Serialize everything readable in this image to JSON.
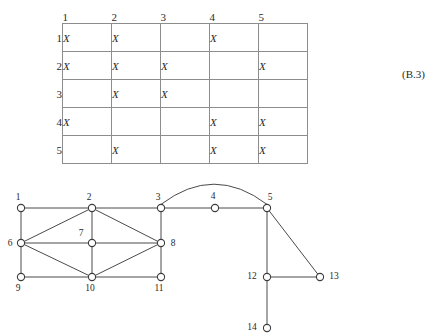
{
  "equation_tag": "(B.3)",
  "matrix": {
    "column_headers": [
      "1",
      "2",
      "3",
      "4",
      "5"
    ],
    "row_headers": [
      "1",
      "2",
      "3",
      "4",
      "5"
    ],
    "mark": "X",
    "rows": [
      [
        "X",
        "X",
        "",
        "X",
        ""
      ],
      [
        "X",
        "X",
        "X",
        "",
        "X"
      ],
      [
        "",
        "X",
        "X",
        "",
        ""
      ],
      [
        "X",
        "",
        "",
        "X",
        "X"
      ],
      [
        "",
        "X",
        "",
        "X",
        "X"
      ]
    ]
  },
  "graph": {
    "nodes": [
      {
        "id": "1",
        "label": "1",
        "cx": 21,
        "cy": 30,
        "lx": 18,
        "ly": 22,
        "anchor": "middle"
      },
      {
        "id": "2",
        "label": "2",
        "cx": 92,
        "cy": 30,
        "lx": 89,
        "ly": 22,
        "anchor": "middle"
      },
      {
        "id": "3",
        "label": "3",
        "cx": 161,
        "cy": 30,
        "lx": 158,
        "ly": 22,
        "anchor": "middle"
      },
      {
        "id": "4",
        "label": "4",
        "cx": 215,
        "cy": 30,
        "lx": 213,
        "ly": 21,
        "anchor": "middle"
      },
      {
        "id": "5",
        "label": "5",
        "cx": 267,
        "cy": 30,
        "lx": 270,
        "ly": 22,
        "anchor": "middle"
      },
      {
        "id": "6",
        "label": "6",
        "cx": 21,
        "cy": 65,
        "lx": 10,
        "ly": 68,
        "anchor": "middle"
      },
      {
        "id": "7",
        "label": "7",
        "cx": 92,
        "cy": 65,
        "lx": 81,
        "ly": 58,
        "anchor": "middle"
      },
      {
        "id": "8",
        "label": "8",
        "cx": 161,
        "cy": 65,
        "lx": 173,
        "ly": 68,
        "anchor": "middle"
      },
      {
        "id": "9",
        "label": "9",
        "cx": 21,
        "cy": 99,
        "lx": 18,
        "ly": 113,
        "anchor": "middle"
      },
      {
        "id": "10",
        "label": "10",
        "cx": 92,
        "cy": 99,
        "lx": 90,
        "ly": 113,
        "anchor": "middle"
      },
      {
        "id": "11",
        "label": "11",
        "cx": 161,
        "cy": 99,
        "lx": 159,
        "ly": 113,
        "anchor": "middle"
      },
      {
        "id": "12",
        "label": "12",
        "cx": 267,
        "cy": 99,
        "lx": 252,
        "ly": 101,
        "anchor": "middle"
      },
      {
        "id": "13",
        "label": "13",
        "cx": 320,
        "cy": 99,
        "lx": 334,
        "ly": 101,
        "anchor": "middle"
      },
      {
        "id": "14",
        "label": "14",
        "cx": 267,
        "cy": 150,
        "lx": 252,
        "ly": 152,
        "anchor": "middle"
      }
    ],
    "edges": [
      [
        "1",
        "2"
      ],
      [
        "2",
        "3"
      ],
      [
        "3",
        "4"
      ],
      [
        "4",
        "5"
      ],
      [
        "1",
        "6"
      ],
      [
        "3",
        "8"
      ],
      [
        "6",
        "9"
      ],
      [
        "8",
        "11"
      ],
      [
        "9",
        "10"
      ],
      [
        "10",
        "11"
      ],
      [
        "6",
        "2"
      ],
      [
        "2",
        "8"
      ],
      [
        "6",
        "10"
      ],
      [
        "10",
        "8"
      ],
      [
        "6",
        "7"
      ],
      [
        "7",
        "8"
      ],
      [
        "2",
        "7"
      ],
      [
        "7",
        "10"
      ],
      [
        "5",
        "12"
      ],
      [
        "5",
        "13"
      ],
      [
        "12",
        "13"
      ],
      [
        "12",
        "14"
      ]
    ],
    "arc_edge": {
      "from": "3",
      "to": "5",
      "peak_y": 8
    }
  }
}
